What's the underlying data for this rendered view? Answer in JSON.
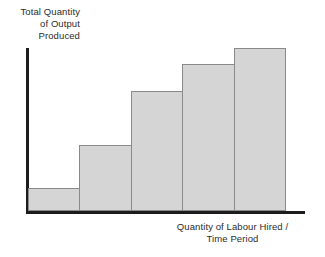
{
  "chart_data": {
    "type": "bar",
    "title": "",
    "subtitle": "",
    "ylabel": "Total Quantity\nof Output\nProduced",
    "xlabel": "Quantity of Labour Hired /\nTime Period",
    "categories": [
      "1",
      "2",
      "3",
      "4",
      "5"
    ],
    "values": [
      23,
      66,
      120,
      147,
      163
    ],
    "ylim": [
      0,
      166
    ],
    "tick_labels_x": [],
    "tick_labels_y": [],
    "grid": false,
    "legend": null,
    "annotations": [],
    "bar_fill_color": "#d5d5d5",
    "bar_border_color": "#8a8a8a",
    "axis_color": "#1c1c1c",
    "text_color": "#2b2b2b",
    "background_color": "#ffffff",
    "bar_gap": 0,
    "note": "Increasing then flattening total product curve rendered as five adjacent bars; axes unlabeled with numeric ticks."
  }
}
